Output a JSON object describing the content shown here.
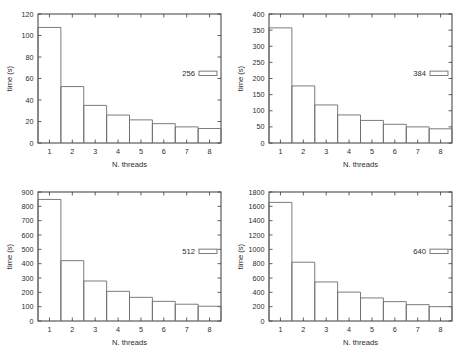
{
  "figure": {
    "layout": "2x2 grid of bar charts",
    "background_color": "#ffffff",
    "axis_color": "#3a3a3a",
    "bar_outline_color": "#6e6e6e",
    "text_color": "#2b2b2b"
  },
  "chart_data": [
    {
      "type": "bar",
      "title": "",
      "xlabel": "N. threads",
      "ylabel": "time (s)",
      "categories": [
        "1",
        "2",
        "3",
        "4",
        "5",
        "6",
        "7",
        "8"
      ],
      "x": [
        1,
        2,
        3,
        4,
        5,
        6,
        7,
        8
      ],
      "values": [
        107.5,
        52.5,
        35.0,
        26.0,
        21.5,
        18.0,
        15.0,
        13.5
      ],
      "xlim": [
        0.5,
        8.5
      ],
      "ylim": [
        0,
        120
      ],
      "yticks": [
        0,
        20,
        40,
        60,
        80,
        100,
        120
      ],
      "xticks": [
        1,
        2,
        3,
        4,
        5,
        6,
        7,
        8
      ],
      "grid": false,
      "legend": {
        "label": "256",
        "position": "right-middle",
        "swatch": "open-rectangle"
      }
    },
    {
      "type": "bar",
      "title": "",
      "xlabel": "N. threads",
      "ylabel": "time (s)",
      "categories": [
        "1",
        "2",
        "3",
        "4",
        "5",
        "6",
        "7",
        "8"
      ],
      "x": [
        1,
        2,
        3,
        4,
        5,
        6,
        7,
        8
      ],
      "values": [
        357.0,
        177.0,
        118.0,
        87.0,
        70.0,
        58.0,
        50.0,
        44.0
      ],
      "xlim": [
        0.5,
        8.5
      ],
      "ylim": [
        0,
        400
      ],
      "yticks": [
        0,
        50,
        100,
        150,
        200,
        250,
        300,
        350,
        400
      ],
      "xticks": [
        1,
        2,
        3,
        4,
        5,
        6,
        7,
        8
      ],
      "grid": false,
      "legend": {
        "label": "384",
        "position": "right-middle",
        "swatch": "open-rectangle"
      }
    },
    {
      "type": "bar",
      "title": "",
      "xlabel": "N. threads",
      "ylabel": "time (s)",
      "categories": [
        "1",
        "2",
        "3",
        "4",
        "5",
        "6",
        "7",
        "8"
      ],
      "x": [
        1,
        2,
        3,
        4,
        5,
        6,
        7,
        8
      ],
      "values": [
        848.0,
        421.0,
        279.0,
        207.0,
        165.0,
        137.0,
        117.0,
        103.0
      ],
      "xlim": [
        0.5,
        8.5
      ],
      "ylim": [
        0,
        900
      ],
      "yticks": [
        0,
        100,
        200,
        300,
        400,
        500,
        600,
        700,
        800,
        900
      ],
      "xticks": [
        1,
        2,
        3,
        4,
        5,
        6,
        7,
        8
      ],
      "grid": false,
      "legend": {
        "label": "512",
        "position": "right-middle",
        "swatch": "open-rectangle"
      }
    },
    {
      "type": "bar",
      "title": "",
      "xlabel": "N. threads",
      "ylabel": "time (s)",
      "categories": [
        "1",
        "2",
        "3",
        "4",
        "5",
        "6",
        "7",
        "8"
      ],
      "x": [
        1,
        2,
        3,
        4,
        5,
        6,
        7,
        8
      ],
      "values": [
        1655.0,
        820.0,
        545.0,
        403.0,
        322.0,
        270.0,
        228.0,
        200.0
      ],
      "xlim": [
        0.5,
        8.5
      ],
      "ylim": [
        0,
        1800
      ],
      "yticks": [
        0,
        200,
        400,
        600,
        800,
        1000,
        1200,
        1400,
        1600,
        1800
      ],
      "xticks": [
        1,
        2,
        3,
        4,
        5,
        6,
        7,
        8
      ],
      "grid": false,
      "legend": {
        "label": "640",
        "position": "right-middle",
        "swatch": "open-rectangle"
      }
    }
  ]
}
